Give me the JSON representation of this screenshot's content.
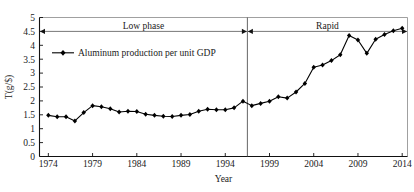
{
  "chart_data": {
    "type": "line",
    "title": "",
    "xlabel": "Year",
    "ylabel": "T(g/$)",
    "xlim": [
      1973,
      2014.6
    ],
    "ylim": [
      0,
      5
    ],
    "xticks": [
      1974,
      1979,
      1984,
      1989,
      1994,
      1999,
      2004,
      2009,
      2014
    ],
    "yticks": [
      0,
      0.5,
      1,
      1.5,
      2,
      2.5,
      3,
      3.5,
      4,
      4.5,
      5
    ],
    "ytick_labels": [
      "0",
      "0.5",
      "1",
      "1.5",
      "2",
      "2.5",
      "3",
      "3.5",
      "4",
      "4.5",
      "5"
    ],
    "xtick_labels": [
      "1974",
      "1979",
      "1984",
      "1989",
      "1994",
      "1999",
      "2004",
      "2009",
      "2014"
    ],
    "grid": false,
    "legend_position": "upper-left",
    "series": [
      {
        "name": "Aluminum production per unit GDP",
        "marker": "diamond",
        "color": "#000000",
        "x": [
          1974,
          1975,
          1976,
          1977,
          1978,
          1979,
          1980,
          1981,
          1982,
          1983,
          1984,
          1985,
          1986,
          1987,
          1988,
          1989,
          1990,
          1991,
          1992,
          1993,
          1994,
          1995,
          1996,
          1997,
          1998,
          1999,
          2000,
          2001,
          2002,
          2003,
          2004,
          2005,
          2006,
          2007,
          2008,
          2009,
          2010,
          2011,
          2012,
          2013,
          2014
        ],
        "values": [
          1.48,
          1.43,
          1.43,
          1.28,
          1.58,
          1.83,
          1.79,
          1.72,
          1.6,
          1.63,
          1.62,
          1.52,
          1.48,
          1.45,
          1.44,
          1.48,
          1.51,
          1.63,
          1.7,
          1.68,
          1.68,
          1.75,
          1.99,
          1.83,
          1.91,
          1.99,
          2.15,
          2.1,
          2.32,
          2.63,
          3.21,
          3.29,
          3.45,
          3.66,
          4.35,
          4.19,
          3.71,
          4.22,
          4.39,
          4.52,
          4.61
        ]
      }
    ],
    "annotations": [
      {
        "name": "low-phase",
        "label": "Low phase",
        "from": 1974,
        "to": 1996.5
      },
      {
        "name": "rapid-phase",
        "label": "Rapid",
        "from": 1996.5,
        "to": 2014
      }
    ],
    "divider_x": 1996.5
  },
  "legend": {
    "entry_label": "Aluminum production per unit GDP"
  },
  "axes": {
    "x_title": "Year",
    "y_title": "T(g/$)"
  }
}
